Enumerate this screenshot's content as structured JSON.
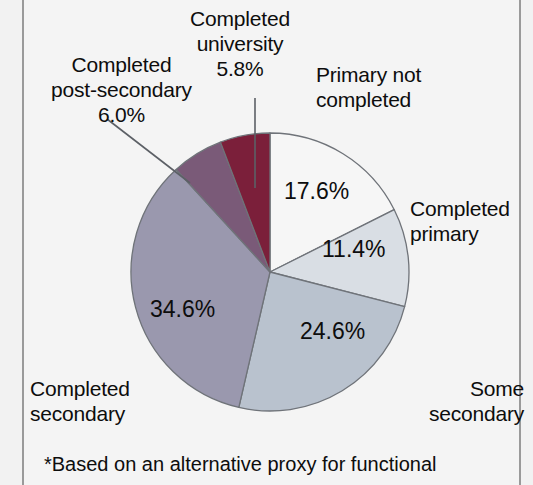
{
  "chart_data": {
    "type": "pie",
    "title": "",
    "subtitle": "",
    "legend_position": "outside-labels",
    "start_angle_deg": 0,
    "direction": "clockwise",
    "categories": [
      "Primary not completed",
      "Completed primary",
      "Some secondary",
      "Completed secondary",
      "Completed post-secondary",
      "Completed university"
    ],
    "values": [
      17.6,
      11.4,
      24.6,
      34.6,
      6.0,
      5.8
    ],
    "value_labels": [
      "17.6%",
      "11.4%",
      "24.6%",
      "34.6%",
      "6.0%",
      "5.8%"
    ],
    "colors": [
      "#f6f6f6",
      "#d9dee4",
      "#b9c2ce",
      "#9a98ae",
      "#7a5a78",
      "#7b1f3a"
    ],
    "slice_border_color": "#6f7379",
    "units": "percent",
    "total": 100.0
  },
  "pie": {
    "slices": [
      {
        "label": "Primary not completed",
        "pct_text": "17.6%",
        "value": 17.6,
        "color": "#f6f6f6"
      },
      {
        "label": "Completed primary",
        "pct_text": "11.4%",
        "value": 11.4,
        "color": "#d9dee4"
      },
      {
        "label": "Some secondary",
        "pct_text": "24.6%",
        "value": 24.6,
        "color": "#b9c2ce"
      },
      {
        "label": "Completed secondary",
        "pct_text": "34.6%",
        "value": 34.6,
        "color": "#9a98ae"
      },
      {
        "label": "Completed post-secondary",
        "pct_text": "6.0%",
        "value": 6.0,
        "color": "#7a5a78"
      },
      {
        "label": "Completed university",
        "pct_text": "5.8%",
        "value": 5.8,
        "color": "#7b1f3a"
      }
    ]
  },
  "labels": {
    "university": "Completed\nuniversity\n5.8%",
    "post_secondary": "Completed\npost-secondary\n6.0%",
    "primary_not_completed": "Primary not\ncompleted",
    "completed_primary": "Completed\nprimary",
    "some_secondary": "Some\nsecondary",
    "completed_secondary": "Completed\nsecondary"
  },
  "values_in_pie": {
    "primary_not_completed": "17.6%",
    "completed_primary": "11.4%",
    "some_secondary": "24.6%",
    "completed_secondary": "34.6%"
  },
  "footnote": {
    "text": "*Based on an alternative proxy for functional"
  },
  "colors": {
    "page_background": "#f4f4f4",
    "text": "#0d0d0d",
    "frame_rule": "#9a9a9a",
    "leader_line": "#5c6066"
  }
}
